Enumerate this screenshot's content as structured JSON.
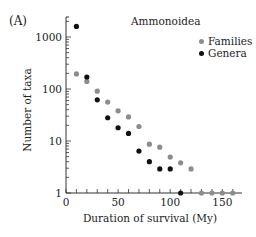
{
  "chart_data": {
    "type": "scatter",
    "panel_label": "(A)",
    "title": "Ammonoidea",
    "xlabel": "Duration of survival (My)",
    "ylabel": "Number of taxa",
    "xlim": [
      0,
      165
    ],
    "ylim": [
      1,
      2400
    ],
    "yscale": "log",
    "x_ticks": [
      0,
      50,
      100,
      150
    ],
    "x_minor_step": 10,
    "y_ticks": [
      1,
      10,
      100,
      1000
    ],
    "y_tick_labels": [
      "1",
      "10",
      "100",
      "1000"
    ],
    "grid": false,
    "legend_position": "upper right",
    "series": [
      {
        "name": "Families",
        "color": "#8c8c8c",
        "points": [
          [
            10,
            195
          ],
          [
            20,
            140
          ],
          [
            30,
            91
          ],
          [
            40,
            56
          ],
          [
            50,
            38
          ],
          [
            60,
            29
          ],
          [
            70,
            19
          ],
          [
            80,
            8.7
          ],
          [
            90,
            7.6
          ],
          [
            100,
            4.9
          ],
          [
            110,
            3.8
          ],
          [
            120,
            2.9
          ],
          [
            130,
            1
          ],
          [
            140,
            1
          ],
          [
            150,
            1
          ],
          [
            160,
            1
          ]
        ]
      },
      {
        "name": "Genera",
        "color": "#111111",
        "points": [
          [
            10,
            1600
          ],
          [
            20,
            170
          ],
          [
            30,
            62
          ],
          [
            40,
            28
          ],
          [
            50,
            18
          ],
          [
            60,
            14
          ],
          [
            70,
            6.4
          ],
          [
            80,
            4
          ],
          [
            90,
            2.9
          ],
          [
            100,
            2.9
          ],
          [
            110,
            1
          ]
        ]
      }
    ]
  }
}
